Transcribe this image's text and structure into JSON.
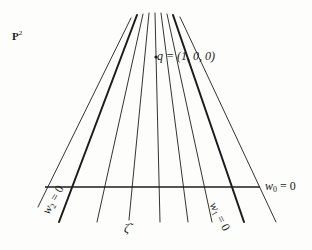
{
  "labels": {
    "space": "P",
    "space_exp": "2",
    "point": "q = (1, 0, 0)",
    "line_w0": "w",
    "line_w0_sub": "0",
    "line_w0_eq": " = 0",
    "line_w1": "w",
    "line_w1_sub": "1",
    "line_w1_eq": " = 0",
    "line_w2": "w",
    "line_w2_sub": "2",
    "line_w2_eq": " = 0",
    "line_zeta": "ζ̃"
  },
  "geometry": {
    "vertex": [
      156,
      57
    ],
    "horizontal_line": {
      "x1": 45,
      "y1": 187,
      "x2": 260,
      "y2": 187,
      "name": "w0"
    },
    "fan_lines": [
      {
        "name": "left-thin",
        "bottom": [
          38,
          207
        ],
        "top": [
          131,
          18
        ],
        "weight": 0.9
      },
      {
        "name": "w2",
        "bottom": [
          59,
          222
        ],
        "top": [
          137,
          15
        ],
        "weight": 2.0
      },
      {
        "name": "line-3",
        "bottom": [
          97,
          222
        ],
        "top": [
          143,
          14
        ],
        "weight": 0.9
      },
      {
        "name": "zeta",
        "bottom": [
          129,
          220
        ],
        "top": [
          149,
          13
        ],
        "weight": 0.9
      },
      {
        "name": "line-5",
        "bottom": [
          160,
          222
        ],
        "top": [
          155,
          13
        ],
        "weight": 0.9
      },
      {
        "name": "line-6",
        "bottom": [
          188,
          222
        ],
        "top": [
          161,
          13
        ],
        "weight": 0.9
      },
      {
        "name": "line-7",
        "bottom": [
          212,
          222
        ],
        "top": [
          167,
          14
        ],
        "weight": 0.9
      },
      {
        "name": "w1",
        "bottom": [
          244,
          222
        ],
        "top": [
          173,
          15
        ],
        "weight": 2.0
      },
      {
        "name": "right-thin",
        "bottom": [
          276,
          222
        ],
        "top": [
          180,
          17
        ],
        "weight": 0.9
      }
    ],
    "stroke_color": "#1c1c1c",
    "background_color": "#fdfdfc"
  }
}
